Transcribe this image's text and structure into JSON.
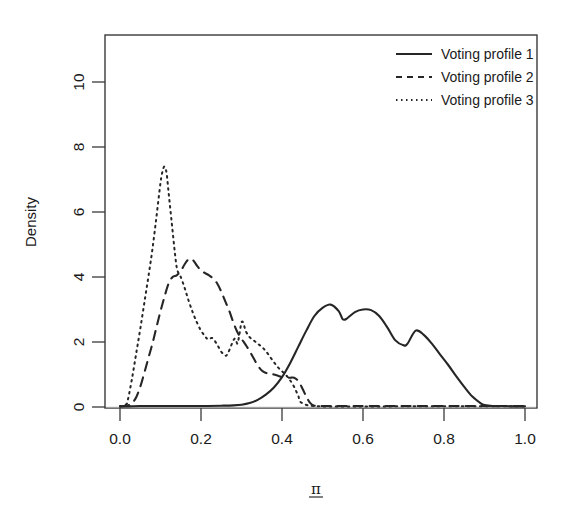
{
  "figure": {
    "kind": "density-plot",
    "background": "#ffffff",
    "ink_color": "#262626"
  },
  "axes": {
    "y_title": "Density",
    "x_title": "π",
    "x_ticks": [
      "0.0",
      "0.2",
      "0.4",
      "0.6",
      "0.8",
      "1.0"
    ],
    "x_tick_values": [
      0.0,
      0.2,
      0.4,
      0.6,
      0.8,
      1.0
    ],
    "y_ticks": [
      "0",
      "2",
      "4",
      "6",
      "8",
      "10"
    ],
    "y_tick_values": [
      0,
      2,
      4,
      6,
      8,
      10
    ]
  },
  "legend": {
    "position": "top-right",
    "entries": [
      {
        "label": "Voting profile 1",
        "style": "solid"
      },
      {
        "label": "Voting profile 2",
        "style": "dashed"
      },
      {
        "label": "Voting profile 3",
        "style": "dotted"
      }
    ]
  },
  "chart_data": {
    "type": "line",
    "title": "",
    "subtitle": "",
    "xlabel": "π",
    "ylabel": "Density",
    "xlim": [
      0.0,
      1.0
    ],
    "ylim": [
      0.0,
      11.5
    ],
    "grid": false,
    "legend_position": "top-right",
    "annotations": [],
    "series": [
      {
        "name": "Voting profile 1",
        "style": "solid",
        "peaks": [
          {
            "x": 0.52,
            "y": 3.15
          },
          {
            "x": 0.62,
            "y": 3.0
          },
          {
            "x": 0.73,
            "y": 2.35
          }
        ],
        "support": [
          0.0,
          1.0
        ],
        "x": [
          0.0,
          0.02,
          0.05,
          0.1,
          0.15,
          0.2,
          0.25,
          0.28,
          0.3,
          0.32,
          0.34,
          0.36,
          0.38,
          0.4,
          0.42,
          0.44,
          0.46,
          0.48,
          0.5,
          0.52,
          0.54,
          0.55,
          0.56,
          0.58,
          0.6,
          0.62,
          0.64,
          0.66,
          0.68,
          0.7,
          0.71,
          0.73,
          0.75,
          0.77,
          0.79,
          0.81,
          0.83,
          0.85,
          0.87,
          0.89,
          0.9,
          0.92,
          0.95,
          0.97,
          1.0
        ],
        "y": [
          0.02,
          0.02,
          0.03,
          0.03,
          0.03,
          0.03,
          0.04,
          0.05,
          0.07,
          0.12,
          0.22,
          0.38,
          0.6,
          0.92,
          1.35,
          1.85,
          2.35,
          2.8,
          3.05,
          3.15,
          2.95,
          2.7,
          2.72,
          2.92,
          3.0,
          2.98,
          2.8,
          2.45,
          2.05,
          1.9,
          1.95,
          2.35,
          2.22,
          1.95,
          1.62,
          1.3,
          0.95,
          0.62,
          0.32,
          0.12,
          0.06,
          0.03,
          0.03,
          0.02,
          0.02
        ]
      },
      {
        "name": "Voting profile 2",
        "style": "dashed",
        "peaks": [
          {
            "x": 0.17,
            "y": 4.55
          },
          {
            "x": 0.43,
            "y": 0.9
          }
        ],
        "support": [
          0.02,
          0.48
        ],
        "x": [
          0.0,
          0.02,
          0.03,
          0.04,
          0.05,
          0.06,
          0.07,
          0.08,
          0.09,
          0.1,
          0.11,
          0.12,
          0.13,
          0.14,
          0.15,
          0.16,
          0.17,
          0.18,
          0.19,
          0.2,
          0.21,
          0.22,
          0.23,
          0.24,
          0.25,
          0.26,
          0.27,
          0.28,
          0.29,
          0.3,
          0.31,
          0.32,
          0.33,
          0.34,
          0.35,
          0.36,
          0.37,
          0.38,
          0.39,
          0.4,
          0.41,
          0.42,
          0.43,
          0.44,
          0.45,
          0.46,
          0.47,
          0.48,
          0.5,
          0.6,
          0.7,
          0.8,
          0.9,
          1.0
        ],
        "y": [
          0.02,
          0.05,
          0.12,
          0.3,
          0.62,
          1.05,
          1.5,
          1.95,
          2.45,
          2.95,
          3.4,
          3.8,
          4.0,
          4.05,
          4.18,
          4.4,
          4.55,
          4.52,
          4.35,
          4.2,
          4.12,
          4.05,
          3.95,
          3.8,
          3.55,
          3.25,
          2.95,
          2.6,
          2.3,
          2.1,
          1.92,
          1.72,
          1.5,
          1.28,
          1.12,
          1.05,
          1.02,
          1.0,
          0.96,
          0.92,
          0.9,
          0.9,
          0.9,
          0.8,
          0.58,
          0.32,
          0.12,
          0.04,
          0.03,
          0.03,
          0.03,
          0.03,
          0.03,
          0.03
        ]
      },
      {
        "name": "Voting profile 3",
        "style": "dotted",
        "peaks": [
          {
            "x": 0.11,
            "y": 7.4
          },
          {
            "x": 0.145,
            "y": 4.1
          },
          {
            "x": 0.225,
            "y": 2.12
          },
          {
            "x": 0.3,
            "y": 2.6
          }
        ],
        "support": [
          0.015,
          0.45
        ],
        "x": [
          0.0,
          0.015,
          0.02,
          0.03,
          0.04,
          0.05,
          0.06,
          0.07,
          0.08,
          0.09,
          0.1,
          0.105,
          0.11,
          0.115,
          0.12,
          0.125,
          0.13,
          0.135,
          0.14,
          0.145,
          0.15,
          0.16,
          0.17,
          0.18,
          0.19,
          0.2,
          0.21,
          0.215,
          0.22,
          0.225,
          0.23,
          0.24,
          0.25,
          0.26,
          0.265,
          0.27,
          0.28,
          0.285,
          0.29,
          0.295,
          0.3,
          0.305,
          0.31,
          0.32,
          0.33,
          0.34,
          0.35,
          0.36,
          0.37,
          0.38,
          0.39,
          0.4,
          0.41,
          0.42,
          0.43,
          0.44,
          0.45,
          0.5,
          0.7,
          1.0
        ],
        "y": [
          0.02,
          0.08,
          0.25,
          0.9,
          1.65,
          2.4,
          3.2,
          4.0,
          4.85,
          5.85,
          6.9,
          7.25,
          7.4,
          7.2,
          6.6,
          6.0,
          5.4,
          4.8,
          4.3,
          4.1,
          4.0,
          3.65,
          3.25,
          2.9,
          2.6,
          2.35,
          2.18,
          2.1,
          2.08,
          2.12,
          2.1,
          1.92,
          1.7,
          1.58,
          1.62,
          1.75,
          2.05,
          2.1,
          1.95,
          2.25,
          2.6,
          2.58,
          2.35,
          2.15,
          2.05,
          1.95,
          1.85,
          1.72,
          1.55,
          1.38,
          1.22,
          1.1,
          0.98,
          0.82,
          0.62,
          0.35,
          0.12,
          0.02,
          0.02,
          0.02
        ]
      }
    ]
  }
}
